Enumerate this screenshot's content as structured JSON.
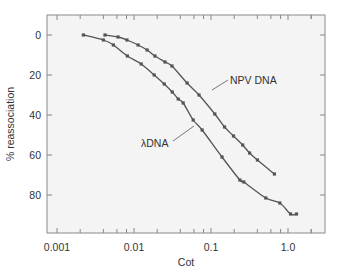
{
  "chart_data": {
    "type": "line",
    "title": "",
    "xlabel": "Cot",
    "ylabel": "% reassociation",
    "xscale": "log",
    "xlim": [
      0.0012,
      2.2
    ],
    "ylim": [
      -10,
      97
    ],
    "y_inverted": true,
    "grid": false,
    "legend": "inline labels",
    "x_tick_labels": [
      "0.001",
      "0.01",
      "0.1",
      "1.0"
    ],
    "x_tick_values": [
      0.001,
      0.01,
      0.1,
      1.0
    ],
    "y_tick_labels": [
      "0",
      "20",
      "40",
      "60",
      "80"
    ],
    "y_tick_values": [
      0,
      20,
      40,
      60,
      80
    ],
    "series": [
      {
        "name": "λDNA",
        "label": "λDNA",
        "x": [
          0.0022,
          0.004,
          0.0054,
          0.0082,
          0.0124,
          0.0183,
          0.0247,
          0.0314,
          0.0375,
          0.0435,
          0.0587,
          0.0767,
          0.139,
          0.237,
          0.267,
          0.515,
          0.783,
          1.08,
          1.29
        ],
        "y": [
          0,
          2.5,
          5,
          10.5,
          14.5,
          20,
          24.5,
          28.5,
          32,
          34,
          42.5,
          47.5,
          61,
          72.5,
          73.5,
          81.5,
          84,
          89.5,
          89.5
        ]
      },
      {
        "name": "NPV DNA",
        "label": "NPV DNA",
        "x": [
          0.0042,
          0.0062,
          0.0081,
          0.0113,
          0.0148,
          0.0187,
          0.0253,
          0.0311,
          0.0489,
          0.0699,
          0.112,
          0.15,
          0.196,
          0.258,
          0.317,
          0.401,
          0.666
        ],
        "y": [
          0,
          1,
          2.5,
          5,
          7.5,
          10.5,
          13.5,
          15.5,
          24,
          30,
          39.5,
          46,
          50.5,
          55,
          59,
          62.5,
          69.5
        ]
      }
    ]
  },
  "labels": {
    "xlabel": "Cot",
    "ylabel": "% reassociation",
    "npv": "NPV DNA",
    "lambda": "λDNA"
  },
  "colors": {
    "background": "#ffffff",
    "plot_bg": "#f4f4f4",
    "frame": "#888888",
    "curve": "#555555",
    "marker": "#555555",
    "text": "#333333"
  }
}
